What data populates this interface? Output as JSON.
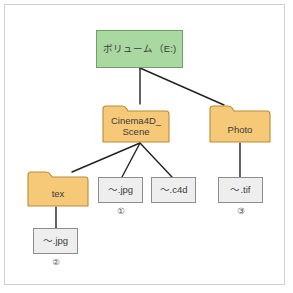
{
  "diagram": {
    "type": "folder-tree",
    "title_visible": false,
    "colors": {
      "drive_fill": "#a9d8a0",
      "drive_stroke": "#6f9e68",
      "folder_fill": "#f5c978",
      "folder_stroke": "#b98b36",
      "file_fill": "#eeeeee",
      "file_stroke": "#8d8d8d",
      "link_stroke": "#222222",
      "frame_stroke": "#cfcfcf",
      "text": "#3b3b3b"
    },
    "nodes": [
      {
        "id": "drive",
        "kind": "drive",
        "label": "ボリューム（E:)",
        "x": 96,
        "y": 30,
        "w": 87,
        "h": 38
      },
      {
        "id": "c4d_dir",
        "kind": "folder",
        "label_line1": "Cinema4D_",
        "label_line2": "Scene",
        "x": 102,
        "y": 104,
        "w": 68,
        "h": 39
      },
      {
        "id": "photo",
        "kind": "folder",
        "label_line1": "Photo",
        "label_line2": "",
        "x": 209,
        "y": 104,
        "w": 62,
        "h": 39
      },
      {
        "id": "tex",
        "kind": "folder",
        "label_line1": "tex",
        "label_line2": "",
        "x": 27,
        "y": 170,
        "w": 62,
        "h": 37
      },
      {
        "id": "jpg1",
        "kind": "file",
        "label": "〜.jpg",
        "x": 98,
        "y": 177,
        "w": 45,
        "h": 26
      },
      {
        "id": "c4d",
        "kind": "file",
        "label": "〜.c4d",
        "x": 151,
        "y": 177,
        "w": 45,
        "h": 26
      },
      {
        "id": "tif",
        "kind": "file",
        "label": "〜.tif",
        "x": 218,
        "y": 177,
        "w": 45,
        "h": 26
      },
      {
        "id": "jpg2",
        "kind": "file",
        "label": "〜.jpg",
        "x": 33,
        "y": 228,
        "w": 45,
        "h": 26
      }
    ],
    "markers": [
      {
        "id": "m1",
        "label": "①",
        "x": 111,
        "y": 206
      },
      {
        "id": "m2",
        "label": "②",
        "x": 46,
        "y": 257
      },
      {
        "id": "m3",
        "label": "③",
        "x": 231,
        "y": 206
      }
    ],
    "edges": [
      {
        "from": "drive",
        "to": "c4d_dir",
        "x1": 140,
        "y1": 68,
        "x2": 140,
        "y2": 104
      },
      {
        "from": "drive",
        "to": "photo",
        "x1": 140,
        "y1": 68,
        "x2": 224,
        "y2": 105
      },
      {
        "from": "c4d_dir",
        "to": "tex",
        "x1": 140,
        "y1": 143,
        "x2": 72,
        "y2": 172
      },
      {
        "from": "c4d_dir",
        "to": "jpg1",
        "x1": 140,
        "y1": 143,
        "x2": 122,
        "y2": 177
      },
      {
        "from": "c4d_dir",
        "to": "c4d",
        "x1": 140,
        "y1": 143,
        "x2": 172,
        "y2": 177
      },
      {
        "from": "photo",
        "to": "tif",
        "x1": 240,
        "y1": 143,
        "x2": 240,
        "y2": 177
      },
      {
        "from": "tex",
        "to": "jpg2",
        "x1": 56,
        "y1": 207,
        "x2": 56,
        "y2": 228
      }
    ]
  }
}
